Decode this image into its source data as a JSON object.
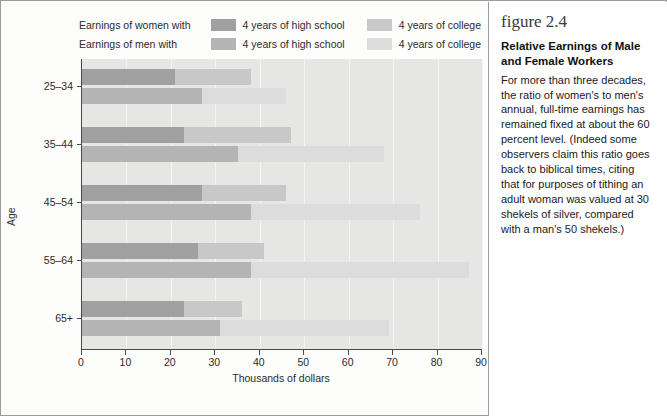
{
  "legend": {
    "rows": [
      {
        "lead": "Earnings of women with",
        "entries": [
          {
            "label": "4 years of high school",
            "color": "#a0a0a0",
            "icon": "legend-swatch-women-hs"
          },
          {
            "label": "4 years of college",
            "color": "#c8c8c8",
            "icon": "legend-swatch-women-college"
          }
        ]
      },
      {
        "lead": "Earnings of men with",
        "entries": [
          {
            "label": "4 years of high school",
            "color": "#b4b4b4",
            "icon": "legend-swatch-men-hs"
          },
          {
            "label": "4 years of college",
            "color": "#dcdcdc",
            "icon": "legend-swatch-men-college"
          }
        ]
      }
    ]
  },
  "sidebar": {
    "figure_number": "figure 2.4",
    "title": "Relative Earnings of Male and Female Workers",
    "body": "For more than three decades, the ratio of women's to men's annual, full-time earnings has remained fixed at about the 60 percent level. (Indeed some observers claim this ratio goes back to biblical times, citing that for purposes of tithing an adult woman was valued at 30 shekels of silver, compared with a man's 50 shekels.)"
  },
  "chart_data": {
    "type": "bar",
    "orientation": "horizontal",
    "title": "Relative Earnings of Male and Female Workers",
    "xlabel": "Thousands of dollars",
    "ylabel": "Age",
    "categories": [
      "25–34",
      "35–44",
      "45–54",
      "55–64",
      "65+"
    ],
    "xlim": [
      0,
      90
    ],
    "xticks": [
      0,
      10,
      20,
      30,
      40,
      50,
      60,
      70,
      80,
      90
    ],
    "grid": "vertical",
    "legend_position": "above-plot",
    "stacked": true,
    "plot_background": "#e6e6e4",
    "series": [
      {
        "name": "Earnings of women with 4 years of high school",
        "group": "women",
        "segment": "high school",
        "color": "#a0a0a0",
        "values": [
          21,
          23,
          27,
          26,
          23
        ]
      },
      {
        "name": "Earnings of women with 4 years of college",
        "group": "women",
        "segment": "college",
        "color": "#c8c8c8",
        "values": [
          38,
          47,
          46,
          41,
          36
        ],
        "note": "cumulative total of the women bar"
      },
      {
        "name": "Earnings of men with 4 years of high school",
        "group": "men",
        "segment": "high school",
        "color": "#b4b4b4",
        "values": [
          27,
          35,
          38,
          38,
          31
        ]
      },
      {
        "name": "Earnings of men with 4 years of college",
        "group": "men",
        "segment": "college",
        "color": "#dcdcdc",
        "values": [
          46,
          68,
          76,
          87,
          69
        ],
        "note": "cumulative total of the men bar"
      }
    ]
  }
}
